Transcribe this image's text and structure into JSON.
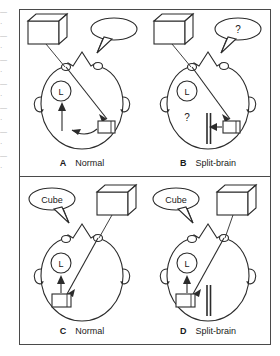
{
  "figure": {
    "panel_order": [
      "A",
      "B",
      "C",
      "D"
    ]
  },
  "page_edge_fragments": [
    "—",
    "·",
    "—",
    "·",
    "—",
    "·",
    "—",
    "·",
    "—",
    "·",
    "—",
    "·",
    "—",
    "·"
  ],
  "panels": [
    {
      "id": "A",
      "letter": "A",
      "label": "Normal",
      "stimulus": {
        "icon": "cube-icon",
        "name": "cube-object",
        "side": "left"
      },
      "bubble": {
        "name": "speech-bubble",
        "text": "Cube",
        "side": "right"
      },
      "hemisphere_marker": {
        "name": "left-hemisphere-label",
        "text": "L"
      },
      "object_in_brain": {
        "name": "cube-representation",
        "side": "right"
      },
      "callosum_cut": false,
      "transfer_arrow": true,
      "question_mark_in_brain": null
    },
    {
      "id": "B",
      "letter": "B",
      "label": "Split-brain",
      "stimulus": {
        "icon": "cube-icon",
        "name": "cube-object",
        "side": "left"
      },
      "bubble": {
        "name": "speech-bubble",
        "text": "?",
        "side": "right"
      },
      "hemisphere_marker": {
        "name": "left-hemisphere-label",
        "text": "L"
      },
      "object_in_brain": {
        "name": "cube-representation",
        "side": "right"
      },
      "callosum_cut": true,
      "transfer_arrow": false,
      "question_mark_in_brain": "?"
    },
    {
      "id": "C",
      "letter": "C",
      "label": "Normal",
      "stimulus": {
        "icon": "cube-icon",
        "name": "cube-object",
        "side": "right"
      },
      "bubble": {
        "name": "speech-bubble",
        "text": "Cube",
        "side": "left"
      },
      "hemisphere_marker": {
        "name": "left-hemisphere-label",
        "text": "L"
      },
      "object_in_brain": {
        "name": "cube-representation",
        "side": "left"
      },
      "callosum_cut": false,
      "transfer_arrow": true,
      "question_mark_in_brain": null
    },
    {
      "id": "D",
      "letter": "D",
      "label": "Split-brain",
      "stimulus": {
        "icon": "cube-icon",
        "name": "cube-object",
        "side": "right"
      },
      "bubble": {
        "name": "speech-bubble",
        "text": "Cube",
        "side": "left"
      },
      "hemisphere_marker": {
        "name": "left-hemisphere-label",
        "text": "L"
      },
      "object_in_brain": {
        "name": "cube-representation",
        "side": "left"
      },
      "callosum_cut": true,
      "transfer_arrow": true,
      "question_mark_in_brain": null
    }
  ],
  "colors": {
    "ink": "#2b2b2b",
    "frame": "#4a4a4a",
    "background": "#ffffff",
    "page_edge_text": "#8d8d8d"
  }
}
